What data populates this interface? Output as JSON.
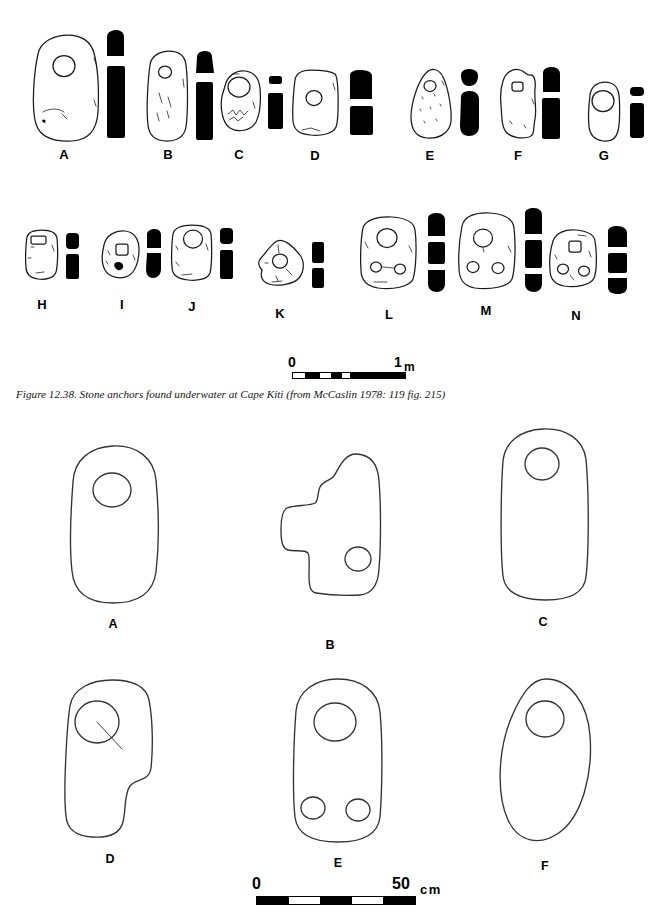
{
  "figure": {
    "caption": "Figure 12.38. Stone anchors found underwater at Cape Kiti (from McCaslin 1978: 119 fig. 215)",
    "title_number": "12.38"
  },
  "upper_plate": {
    "labels": [
      "A",
      "B",
      "C",
      "D",
      "E",
      "F",
      "G",
      "H",
      "I",
      "J",
      "K",
      "L",
      "M",
      "N"
    ],
    "row1": [
      {
        "label": "A",
        "hole_count": 1,
        "hole_shape": "round",
        "views": [
          "outline",
          "top-silhouette",
          "side-silhouette"
        ]
      },
      {
        "label": "B",
        "hole_count": 1,
        "hole_shape": "round",
        "views": [
          "outline",
          "top-silhouette",
          "side-silhouette"
        ]
      },
      {
        "label": "C",
        "hole_count": 1,
        "hole_shape": "round",
        "views": [
          "outline",
          "top-silhouette",
          "side-silhouette"
        ]
      },
      {
        "label": "D",
        "hole_count": 1,
        "hole_shape": "round",
        "views": [
          "outline",
          "top-silhouette",
          "side-silhouette"
        ]
      },
      {
        "label": "E",
        "hole_count": 1,
        "hole_shape": "round",
        "views": [
          "outline",
          "top-silhouette",
          "side-silhouette"
        ]
      },
      {
        "label": "F",
        "hole_count": 1,
        "hole_shape": "square",
        "views": [
          "outline",
          "top-silhouette",
          "side-silhouette"
        ]
      },
      {
        "label": "G",
        "hole_count": 1,
        "hole_shape": "round",
        "views": [
          "outline",
          "top-silhouette",
          "side-silhouette"
        ]
      }
    ],
    "row2": [
      {
        "label": "H",
        "hole_count": 1,
        "hole_shape": "rectangular",
        "views": [
          "outline",
          "top-silhouette",
          "side-silhouette"
        ]
      },
      {
        "label": "I",
        "hole_count": 1,
        "hole_shape": "square",
        "views": [
          "outline",
          "top-silhouette",
          "side-silhouette"
        ]
      },
      {
        "label": "J",
        "hole_count": 1,
        "hole_shape": "round",
        "views": [
          "outline",
          "top-silhouette",
          "side-silhouette"
        ]
      },
      {
        "label": "K",
        "hole_count": 1,
        "hole_shape": "round",
        "views": [
          "outline",
          "top-silhouette",
          "side-silhouette"
        ]
      },
      {
        "label": "L",
        "hole_count": 3,
        "hole_shape": "round",
        "views": [
          "outline",
          "silhouette-upper",
          "silhouette-middle",
          "silhouette-lower"
        ]
      },
      {
        "label": "M",
        "hole_count": 3,
        "hole_shape": "round",
        "views": [
          "outline",
          "silhouette-upper",
          "silhouette-middle",
          "silhouette-lower"
        ]
      },
      {
        "label": "N",
        "hole_count": 3,
        "hole_shape": "square-and-round",
        "views": [
          "outline",
          "silhouette-upper",
          "silhouette-middle",
          "silhouette-lower"
        ]
      }
    ],
    "scale": {
      "start_label": "0",
      "end_label": "1",
      "unit": "m",
      "segments": 2,
      "segment_pattern": [
        "light",
        "dark",
        "light",
        "dark",
        "dark"
      ]
    }
  },
  "lower_plate": {
    "items": [
      {
        "label": "A",
        "shape": "rounded-rectangle",
        "hole_count": 1,
        "hole_shape": "round",
        "annotation": ""
      },
      {
        "label": "B",
        "shape": "irregular-lobed",
        "hole_count": 1,
        "hole_shape": "round",
        "annotation": ""
      },
      {
        "label": "C",
        "shape": "tall-rounded-rectangle",
        "hole_count": 1,
        "hole_shape": "round",
        "annotation": ""
      },
      {
        "label": "D",
        "shape": "irregular-stepped",
        "hole_count": 1,
        "hole_shape": "round",
        "annotation": "blind"
      },
      {
        "label": "E",
        "shape": "rounded-rectangle",
        "hole_count": 3,
        "hole_shape": "round",
        "annotation": ""
      },
      {
        "label": "F",
        "shape": "ovoid",
        "hole_count": 1,
        "hole_shape": "round",
        "annotation": ""
      }
    ],
    "annotations": {
      "blind": "blind"
    },
    "scale": {
      "start_label": "0",
      "end_label": "50",
      "unit": "cm",
      "segments": 5,
      "segment_pattern": [
        "dark",
        "light",
        "dark",
        "light",
        "dark"
      ]
    }
  },
  "colors": {
    "ink": "#1a1a1a",
    "silhouette": "#000000",
    "paper": "#ffffff"
  }
}
